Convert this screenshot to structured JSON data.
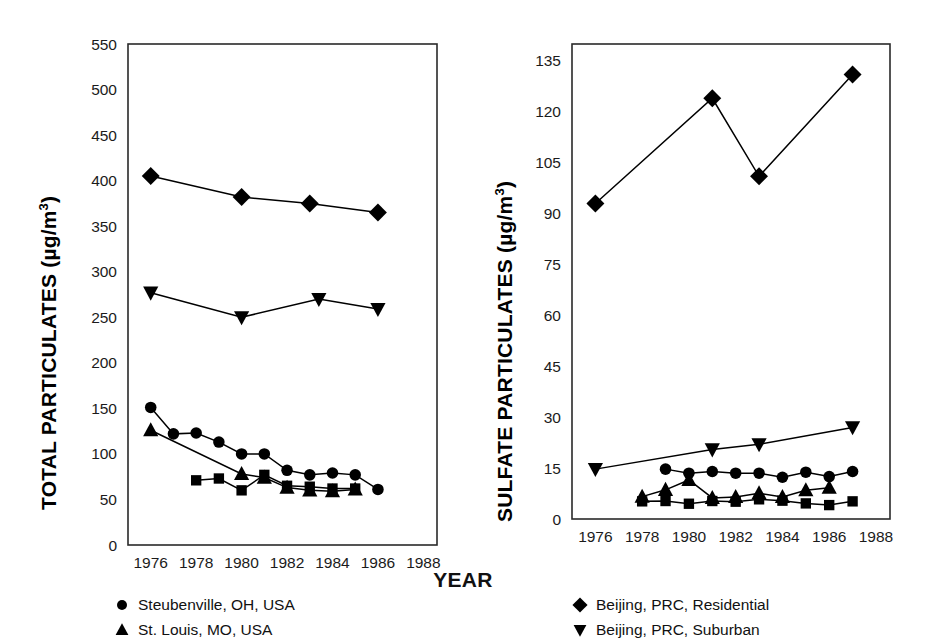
{
  "xlabel": "YEAR",
  "panels": [
    {
      "id": "left",
      "ylabel_main": "TOTAL PARTICULATES (",
      "ylabel_unit": "µg/m",
      "ylabel_exp": "3",
      "ylabel_close": ")",
      "yticks": [
        "0",
        "50",
        "100",
        "150",
        "200",
        "250",
        "300",
        "350",
        "400",
        "450",
        "500",
        "550"
      ],
      "xticks": [
        "1976",
        "1978",
        "1980",
        "1982",
        "1984",
        "1986",
        "1988"
      ],
      "legend": [
        {
          "marker": "circle",
          "label": "Steubenville, OH, USA"
        },
        {
          "marker": "triangle-up",
          "label": "St. Louis, MO, USA"
        }
      ]
    },
    {
      "id": "right",
      "ylabel_main": "SULFATE PARTICULATES (",
      "ylabel_unit": "µg/m",
      "ylabel_exp": "3",
      "ylabel_close": ")",
      "yticks": [
        "0",
        "15",
        "30",
        "45",
        "60",
        "75",
        "90",
        "105",
        "120",
        "135"
      ],
      "xticks": [
        "1976",
        "1978",
        "1980",
        "1982",
        "1984",
        "1986",
        "1988"
      ],
      "legend": [
        {
          "marker": "diamond",
          "label": "Beijing, PRC, Residential"
        },
        {
          "marker": "triangle-down",
          "label": "Beijing, PRC, Suburban"
        }
      ]
    }
  ],
  "chart_data": [
    {
      "type": "line",
      "id": "left",
      "title": "",
      "xlabel": "YEAR",
      "ylabel": "TOTAL PARTICULATES (µg/m3)",
      "xlim": [
        1975,
        1988.6
      ],
      "ylim": [
        0,
        550
      ],
      "ytick_step": 50,
      "xtick_step": 2,
      "grid": false,
      "legend_position": "below",
      "series": [
        {
          "name": "Beijing, PRC, Residential",
          "marker": "diamond",
          "x": [
            1976,
            1980,
            1983,
            1986
          ],
          "y": [
            405,
            382,
            375,
            365
          ]
        },
        {
          "name": "Beijing, PRC, Suburban",
          "marker": "triangle-down",
          "x": [
            1976,
            1980,
            1983.4,
            1986
          ],
          "y": [
            277,
            250,
            270,
            259
          ]
        },
        {
          "name": "Steubenville, OH, USA",
          "marker": "circle",
          "x": [
            1976,
            1977,
            1978,
            1979,
            1980,
            1981,
            1982,
            1983,
            1984,
            1985,
            1986
          ],
          "y": [
            151,
            122,
            123,
            113,
            100,
            100,
            82,
            77,
            79,
            77,
            61
          ]
        },
        {
          "name": "St. Louis, MO, USA",
          "marker": "triangle-up",
          "x": [
            1976,
            1980,
            1981,
            1982,
            1983,
            1984,
            1985
          ],
          "y": [
            126,
            78,
            74,
            63,
            60,
            59,
            61
          ]
        },
        {
          "name": "unlabeled-square",
          "marker": "square",
          "x": [
            1978,
            1979,
            1980,
            1981,
            1982,
            1983,
            1984,
            1985
          ],
          "y": [
            71,
            73,
            60,
            77,
            65,
            64,
            62,
            62
          ]
        }
      ]
    },
    {
      "type": "line",
      "id": "right",
      "title": "",
      "xlabel": "YEAR",
      "ylabel": "SULFATE PARTICULATES (µg/m3)",
      "xlim": [
        1975,
        1988.6
      ],
      "ylim": [
        0,
        140
      ],
      "ytick_step": 15,
      "xtick_step": 2,
      "grid": false,
      "legend_position": "below",
      "series": [
        {
          "name": "Beijing, PRC, Residential",
          "marker": "diamond",
          "x": [
            1976,
            1981,
            1983,
            1987
          ],
          "y": [
            93,
            124,
            101,
            131
          ]
        },
        {
          "name": "Beijing, PRC, Suburban",
          "marker": "triangle-down",
          "x": [
            1976,
            1981,
            1983,
            1987
          ],
          "y": [
            14.7,
            20.5,
            22,
            27
          ]
        },
        {
          "name": "Steubenville, OH, USA",
          "marker": "circle",
          "x": [
            1979,
            1980,
            1981,
            1982,
            1983,
            1984,
            1985,
            1986,
            1987
          ],
          "y": [
            14.7,
            13.5,
            14,
            13.5,
            13.5,
            12.3,
            13.8,
            12.5,
            14
          ]
        },
        {
          "name": "St. Louis, MO, USA",
          "marker": "triangle-up",
          "x": [
            1978,
            1979,
            1980,
            1981,
            1982,
            1983,
            1984,
            1985,
            1986
          ],
          "y": [
            6.6,
            8.6,
            11.5,
            6.2,
            6.5,
            7.6,
            6.5,
            8.5,
            9.2
          ]
        },
        {
          "name": "unlabeled-square",
          "marker": "square",
          "x": [
            1978,
            1979,
            1980,
            1981,
            1982,
            1983,
            1984,
            1985,
            1986,
            1987
          ],
          "y": [
            5.2,
            5.3,
            4.5,
            5.3,
            5.1,
            5.8,
            5.4,
            4.6,
            4.1,
            5.2
          ]
        }
      ]
    }
  ]
}
